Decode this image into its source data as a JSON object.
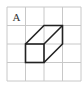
{
  "diagram": {
    "type": "grid-with-cuboid",
    "grid": {
      "rows": 4,
      "cols": 4,
      "line_color": "#c8c8c8"
    },
    "label": "A",
    "shape": {
      "name": "cuboid",
      "stroke_color": "#222222",
      "front_face": "unit square at column 2, row 3",
      "depth_offset": "one cell up and one cell right"
    }
  }
}
